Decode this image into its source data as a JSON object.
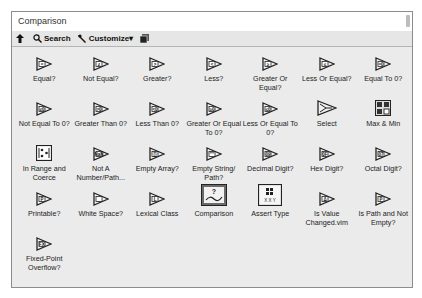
{
  "window": {
    "title": "Comparison"
  },
  "toolbar": {
    "up_icon": "up-arrow-icon",
    "search_label": "Search",
    "customize_label": "Customize▾",
    "view_icon": "palette-view-icon"
  },
  "palette": {
    "items": [
      {
        "label": "Equal?",
        "icon": "equal-icon",
        "glyph": "="
      },
      {
        "label": "Not Equal?",
        "icon": "not-equal-icon",
        "glyph": "≠"
      },
      {
        "label": "Greater?",
        "icon": "greater-icon",
        "glyph": ">"
      },
      {
        "label": "Less?",
        "icon": "less-icon",
        "glyph": "<"
      },
      {
        "label": "Greater Or Equal?",
        "icon": "greater-or-equal-icon",
        "glyph": "≥"
      },
      {
        "label": "Less Or Equal?",
        "icon": "less-or-equal-icon",
        "glyph": "≤"
      },
      {
        "label": "Equal To 0?",
        "icon": "equal-to-zero-icon",
        "glyph": "=0"
      },
      {
        "label": "Not Equal To 0?",
        "icon": "not-equal-to-zero-icon",
        "glyph": "≠0"
      },
      {
        "label": "Greater Than 0?",
        "icon": "greater-than-zero-icon",
        "glyph": ">0"
      },
      {
        "label": "Less Than 0?",
        "icon": "less-than-zero-icon",
        "glyph": "<0"
      },
      {
        "label": "Greater Or Equal To 0?",
        "icon": "greater-or-equal-zero-icon",
        "glyph": "≥0"
      },
      {
        "label": "Less Or Equal To 0?",
        "icon": "less-or-equal-zero-icon",
        "glyph": "≤0"
      },
      {
        "label": "Select",
        "icon": "select-icon",
        "glyph": ""
      },
      {
        "label": "Max & Min",
        "icon": "max-min-icon",
        "glyph": ""
      },
      {
        "label": "In Range and Coerce",
        "icon": "in-range-coerce-icon",
        "glyph": ""
      },
      {
        "label": "Not A Number/Path...",
        "icon": "not-a-number-icon",
        "glyph": "NaN"
      },
      {
        "label": "Empty Array?",
        "icon": "empty-array-icon",
        "glyph": "[]"
      },
      {
        "label": "Empty String/ Path?",
        "icon": "empty-string-path-icon",
        "glyph": "\"\""
      },
      {
        "label": "Decimal Digit?",
        "icon": "decimal-digit-icon",
        "glyph": "09"
      },
      {
        "label": "Hex Digit?",
        "icon": "hex-digit-icon",
        "glyph": "0F"
      },
      {
        "label": "Octal Digit?",
        "icon": "octal-digit-icon",
        "glyph": "07"
      },
      {
        "label": "Printable?",
        "icon": "printable-icon",
        "glyph": "P"
      },
      {
        "label": "White Space?",
        "icon": "white-space-icon",
        "glyph": "_"
      },
      {
        "label": "Lexical Class",
        "icon": "lexical-class-icon",
        "glyph": "L"
      },
      {
        "label": "Comparison",
        "icon": "comparison-express-icon",
        "glyph": ""
      },
      {
        "label": "Assert Type",
        "icon": "assert-type-icon",
        "glyph": ""
      },
      {
        "label": "Is Value Changed.vim",
        "icon": "is-value-changed-icon",
        "glyph": "Δ"
      },
      {
        "label": "Is Path and Not Empty?",
        "icon": "is-path-not-empty-icon",
        "glyph": "P"
      },
      {
        "label": "Fixed-Point Overflow?",
        "icon": "fixed-point-overflow-icon",
        "glyph": "FX"
      }
    ]
  }
}
